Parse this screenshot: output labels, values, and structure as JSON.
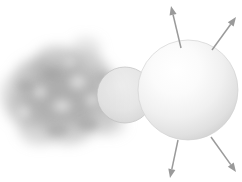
{
  "figure": {
    "width": 242,
    "height": 182,
    "background_color": "#ffffff",
    "caption": ""
  },
  "chart_data": {
    "type": "diagram",
    "xlabel": "",
    "ylabel": "",
    "grid": false,
    "legend": "none",
    "xlim": [
      0,
      242
    ],
    "ylim": [
      0,
      182
    ],
    "elements": [
      {
        "name": "gas-cloud",
        "label": "Diffuse gas cloud",
        "shape": "irregular-blob",
        "cx": 63,
        "cy": 95,
        "rx": 62,
        "ry": 52,
        "fill": "#b4b4b4",
        "opacity": 0.85,
        "blur": 7
      },
      {
        "name": "small-sphere",
        "label": "Contracting core",
        "shape": "circle",
        "cx": 125,
        "cy": 95,
        "r": 28,
        "fill": "#e2e2e2",
        "stroke": "#b9b9b9",
        "opacity": 0.9
      },
      {
        "name": "large-sphere",
        "label": "Protostar",
        "shape": "circle",
        "cx": 188,
        "cy": 90,
        "r": 50,
        "fill": "#f4f4f4",
        "highlight_color": "#ffffff",
        "shadow_color": "#c8c8c8",
        "highlight_x": 168,
        "highlight_y": 66
      }
    ],
    "arrows": [
      {
        "name": "arrow-top-left",
        "label": "Outflow",
        "x1": 181,
        "y1": 48,
        "x2": 171,
        "y2": 6,
        "color": "#9a9a9a"
      },
      {
        "name": "arrow-top-right",
        "label": "Outflow",
        "x1": 212,
        "y1": 50,
        "x2": 236,
        "y2": 17,
        "color": "#9a9a9a"
      },
      {
        "name": "arrow-bottom-left",
        "label": "Outflow",
        "x1": 178,
        "y1": 140,
        "x2": 170,
        "y2": 178,
        "color": "#9a9a9a"
      },
      {
        "name": "arrow-bottom-right",
        "label": "Outflow",
        "x1": 211,
        "y1": 137,
        "x2": 236,
        "y2": 172,
        "color": "#9a9a9a"
      }
    ],
    "colors": {
      "cloud_gray": "#b4b4b4",
      "sphere_light": "#ffffff",
      "sphere_shadow": "#c8c8c8",
      "arrow_gray": "#9a9a9a",
      "background": "#ffffff"
    }
  }
}
